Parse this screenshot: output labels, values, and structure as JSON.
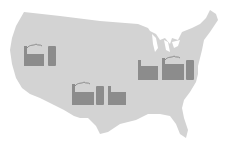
{
  "map": {
    "region": "United States (contiguous)",
    "land_color": "#d3d3d3",
    "background_color": "#ffffff",
    "icon_color": "#8c8c8c",
    "markers": [
      {
        "id": "west",
        "icon": "factory-icon",
        "x": 24,
        "y": 42
      },
      {
        "id": "southwest",
        "icon": "factory-icon",
        "x": 72,
        "y": 80
      },
      {
        "id": "midwest-east",
        "icon": "factory-icon",
        "x": 138,
        "y": 56
      }
    ]
  }
}
